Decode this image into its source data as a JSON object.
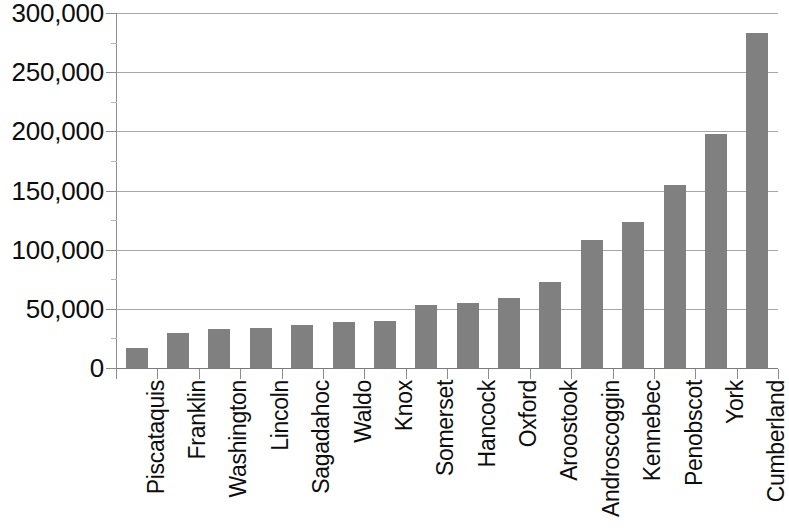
{
  "chart_data": {
    "type": "bar",
    "title": "",
    "subtitle": "",
    "xlabel": "",
    "ylabel": "",
    "ylim": [
      0,
      300000
    ],
    "ytick_step": 50000,
    "grid": true,
    "legend": false,
    "legend_position": "none",
    "orientation": "vertical",
    "bar_color": "#808080",
    "gridline_color": "#a6a6a6",
    "axis_color": "#8c8c8c",
    "background_color": "#ffffff",
    "categories": [
      "Piscataquis",
      "Franklin",
      "Washington",
      "Lincoln",
      "Sagadahoc",
      "Waldo",
      "Knox",
      "Somerset",
      "Hancock",
      "Oxford",
      "Aroostook",
      "Androscoggin",
      "Kennebec",
      "Penobscot",
      "York",
      "Cumberland"
    ],
    "values": [
      17000,
      30000,
      33000,
      34000,
      36000,
      39000,
      40000,
      53000,
      55000,
      59000,
      73000,
      108000,
      123000,
      155000,
      198000,
      283000
    ],
    "ytick_labels": [
      "0",
      "50,000",
      "100,000",
      "150,000",
      "200,000",
      "250,000",
      "300,000"
    ],
    "ytick_values": [
      0,
      50000,
      100000,
      150000,
      200000,
      250000,
      300000
    ]
  }
}
